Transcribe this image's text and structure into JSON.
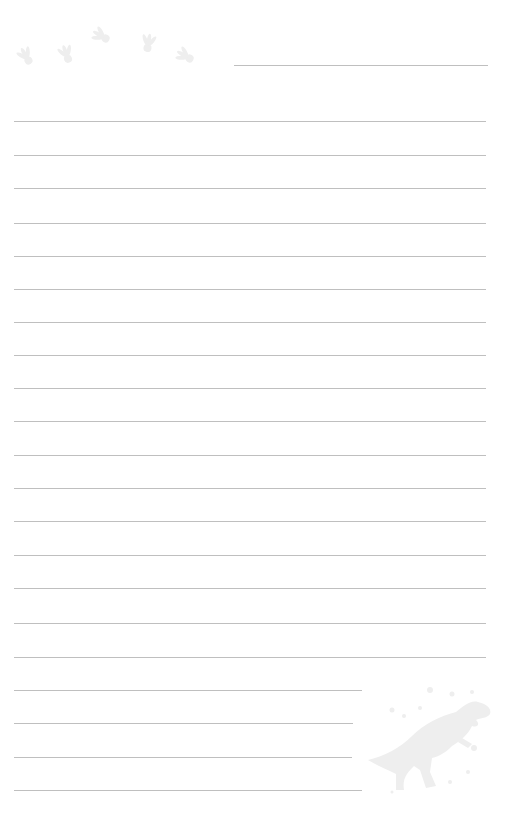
{
  "page": {
    "type": "lined writing paper",
    "background_color": "#ffffff",
    "line_color": "#b4b4b4",
    "decoration_color": "#eeeeee"
  },
  "header_line": {
    "x1": 234,
    "x2": 488,
    "y": 65
  },
  "full_lines": {
    "x1": 14,
    "x2": 486,
    "y": [
      121,
      155,
      188,
      223,
      256,
      289,
      322,
      355,
      388,
      421,
      455,
      488,
      521,
      555,
      588,
      623,
      657
    ]
  },
  "short_lines": [
    {
      "x1": 14,
      "x2": 362,
      "y": 690
    },
    {
      "x1": 14,
      "x2": 353,
      "y": 723
    },
    {
      "x1": 14,
      "x2": 352,
      "y": 757
    },
    {
      "x1": 14,
      "x2": 362,
      "y": 790
    }
  ],
  "footprints": [
    {
      "icon": "dinosaur-footprint-icon",
      "x": 27,
      "y": 58,
      "rotate": -30
    },
    {
      "icon": "dinosaur-footprint-icon",
      "x": 67,
      "y": 56,
      "rotate": -20
    },
    {
      "icon": "dinosaur-footprint-icon",
      "x": 103,
      "y": 37,
      "rotate": -60
    },
    {
      "icon": "dinosaur-footprint-icon",
      "x": 148,
      "y": 45,
      "rotate": 10
    },
    {
      "icon": "dinosaur-footprint-icon",
      "x": 187,
      "y": 57,
      "rotate": -60
    }
  ],
  "dinosaur": {
    "icon": "t-rex-silhouette-icon",
    "x": 365,
    "y": 690,
    "width": 130,
    "height": 110
  }
}
